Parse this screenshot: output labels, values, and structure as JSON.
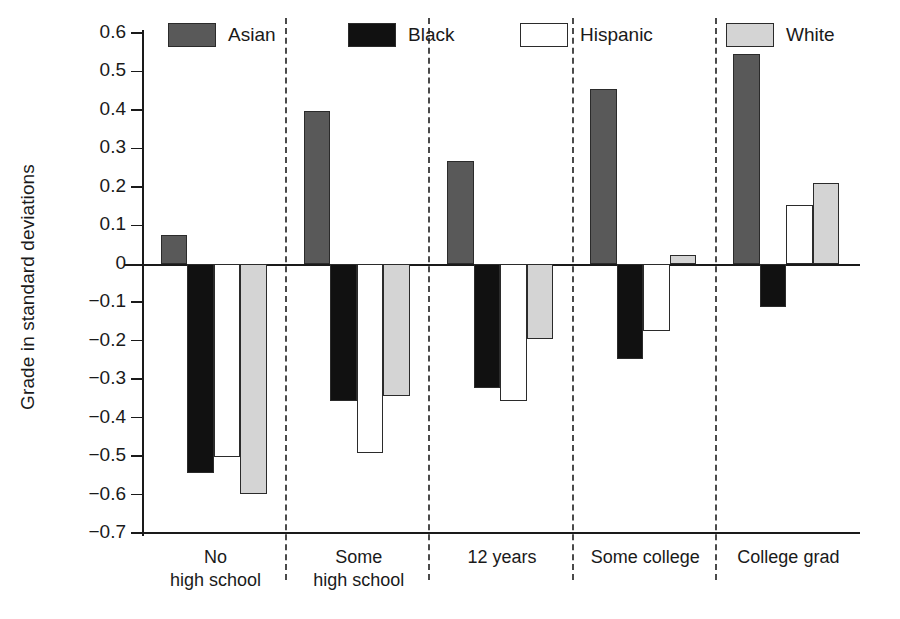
{
  "chart_data": {
    "type": "bar",
    "title": "",
    "subtitle": "",
    "xlabel": "",
    "ylabel": "Grade in standard deviations",
    "ylim": [
      -0.7,
      0.6
    ],
    "ytick_labels": [
      "0.6",
      "0.5",
      "0.4",
      "0.3",
      "0.2",
      "0.1",
      "0",
      "−0.1",
      "−0.2",
      "−0.3",
      "−0.4",
      "−0.5",
      "−0.6",
      "−0.7"
    ],
    "ytick_values": [
      0.6,
      0.5,
      0.4,
      0.3,
      0.2,
      0.1,
      0,
      -0.1,
      -0.2,
      -0.3,
      -0.4,
      -0.5,
      -0.6,
      -0.7
    ],
    "grid": false,
    "legend_position": "top",
    "zero_reference_line": true,
    "group_dividers": true,
    "categories": [
      "No high school",
      "Some high school",
      "12 years",
      "Some college",
      "College grad"
    ],
    "category_lines": [
      [
        "No",
        "high school"
      ],
      [
        "Some",
        "high school"
      ],
      [
        "12 years",
        ""
      ],
      [
        "Some college",
        ""
      ],
      [
        "College grad",
        ""
      ]
    ],
    "series": [
      {
        "name": "Asian",
        "color": "#595959",
        "values": [
          0.075,
          0.398,
          0.268,
          0.455,
          0.546
        ]
      },
      {
        "name": "Black",
        "color": "#111111",
        "values": [
          -0.545,
          -0.357,
          -0.322,
          -0.248,
          -0.113
        ]
      },
      {
        "name": "Hispanic",
        "color": "#ffffff",
        "values": [
          -0.503,
          -0.492,
          -0.358,
          -0.175,
          0.153
        ]
      },
      {
        "name": "White",
        "color": "#d4d4d4",
        "values": [
          -0.598,
          -0.345,
          -0.195,
          0.024,
          0.209
        ]
      }
    ]
  }
}
